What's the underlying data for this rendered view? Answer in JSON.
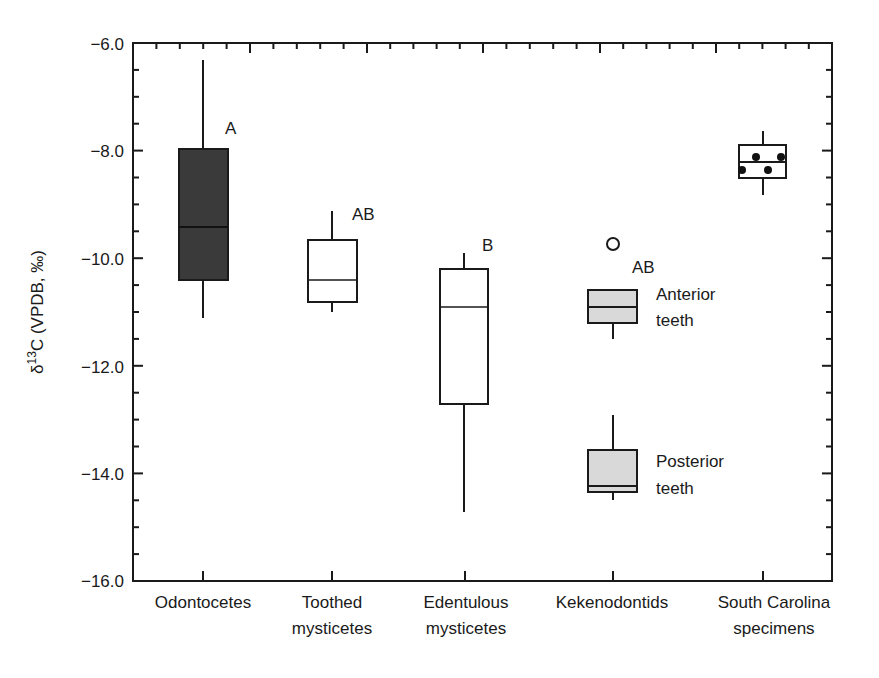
{
  "chart_data": {
    "type": "box",
    "title": "",
    "xlabel": "",
    "ylabel": "δ13C (VPDB, ‰)",
    "ylabel_parts": {
      "prefix": "δ",
      "sup": "13",
      "suffix": "C (VPDB, ‰)"
    },
    "ylim": [
      -16.0,
      -6.0
    ],
    "yticks": [
      -6.0,
      -8.0,
      -10.0,
      -12.0,
      -14.0,
      -16.0
    ],
    "ytick_labels": [
      "−6.0",
      "−8.0",
      "−10.0",
      "−12.0",
      "−14.0",
      "−16.0"
    ],
    "minor_ytick_step": 0.5,
    "grid": false,
    "legend": null,
    "categories": [
      {
        "label_lines": [
          "Odontocetes"
        ]
      },
      {
        "label_lines": [
          "Toothed",
          "mysticetes"
        ]
      },
      {
        "label_lines": [
          "Edentulous",
          "mysticetes"
        ]
      },
      {
        "label_lines": [
          "Kekenodontids"
        ]
      },
      {
        "label_lines": [
          "South Carolina",
          "specimens"
        ]
      }
    ],
    "boxes": [
      {
        "category": "Odontocetes",
        "whisker_high": -6.3,
        "q3": -8.0,
        "median": -9.4,
        "q1": -10.4,
        "whisker_low": -11.1,
        "fill": "#3a3a3a",
        "annotation": "A"
      },
      {
        "category": "Toothed mysticetes",
        "whisker_high": -9.1,
        "q3": -9.65,
        "median": -10.4,
        "q1": -10.8,
        "whisker_low": -11.0,
        "fill": "#ffffff",
        "annotation": "AB"
      },
      {
        "category": "Edentulous mysticetes",
        "whisker_high": -9.9,
        "q3": -10.2,
        "median": -10.9,
        "q1": -12.7,
        "whisker_low": -14.7,
        "fill": "#ffffff",
        "annotation": "B"
      },
      {
        "category": "Kekenodontids",
        "subgroup": "Anterior teeth",
        "whisker_high": null,
        "q3": -10.6,
        "median": -10.9,
        "q1": -11.2,
        "whisker_low": -11.5,
        "outliers": [
          -9.7
        ],
        "fill": "#d9d9d9",
        "annotation": "AB"
      },
      {
        "category": "Kekenodontids",
        "subgroup": "Posterior teeth",
        "whisker_high": -12.9,
        "q3": -13.55,
        "median": -14.2,
        "q1": -14.35,
        "whisker_low": -14.5,
        "fill": "#d9d9d9"
      },
      {
        "category": "South Carolina specimens",
        "whisker_high": -7.6,
        "q3": -7.9,
        "median": -8.25,
        "q1": -8.5,
        "whisker_low": -8.8,
        "fill": "#ffffff",
        "points": [
          -8.15,
          -8.15,
          -8.4,
          -8.4
        ]
      }
    ],
    "annotations": [
      {
        "text": "A",
        "near": "Odontocetes"
      },
      {
        "text": "AB",
        "near": "Toothed mysticetes"
      },
      {
        "text": "B",
        "near": "Edentulous mysticetes"
      },
      {
        "text": "AB",
        "near": "Kekenodontids"
      },
      {
        "text": "Anterior",
        "near": "Kekenodontids anterior box"
      },
      {
        "text": "teeth",
        "near": "Kekenodontids anterior box"
      },
      {
        "text": "Posterior",
        "near": "Kekenodontids posterior box"
      },
      {
        "text": "teeth",
        "near": "Kekenodontids posterior box"
      }
    ]
  },
  "labels": {
    "y_sup": "13",
    "y_prefix": "δ",
    "y_suffix": "C (VPDB, ‰)",
    "yticks": [
      "−6.0",
      "−8.0",
      "−10.0",
      "−12.0",
      "−14.0",
      "−16.0"
    ],
    "cats": {
      "c0a": "Odontocetes",
      "c1a": "Toothed",
      "c1b": "mysticetes",
      "c2a": "Edentulous",
      "c2b": "mysticetes",
      "c3a": "Kekenodontids",
      "c4a": "South Carolina",
      "c4b": "specimens"
    },
    "annot": {
      "a0": "A",
      "a1": "AB",
      "a2": "B",
      "a3": "AB",
      "ant1": "Anterior",
      "ant2": "teeth",
      "post1": "Posterior",
      "post2": "teeth"
    }
  },
  "colors": {
    "axis": "#1a1a1a",
    "dark_fill": "#3a3a3a",
    "light_fill": "#d9d9d9",
    "white_fill": "#ffffff"
  }
}
